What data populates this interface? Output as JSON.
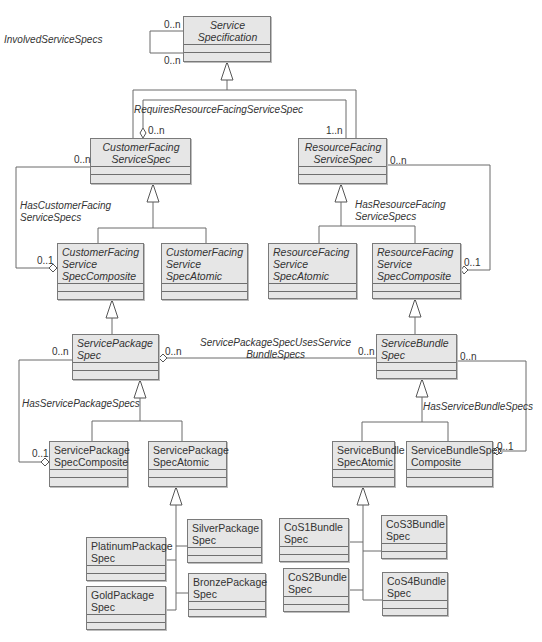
{
  "classes": [
    {
      "id": "service_specification",
      "name": "Service\nSpecification",
      "abstract": true,
      "center": true,
      "x": 183,
      "y": 16,
      "w": 88,
      "h": 46
    },
    {
      "id": "customer_facing_service_spec",
      "name": "CustomerFacing\nServiceSpec",
      "abstract": true,
      "center": true,
      "x": 90,
      "y": 138,
      "w": 101,
      "h": 46
    },
    {
      "id": "resource_facing_service_spec",
      "name": "ResourceFacing\nServiceSpec",
      "abstract": true,
      "center": true,
      "x": 298,
      "y": 138,
      "w": 89,
      "h": 46
    },
    {
      "id": "cfs_spec_composite",
      "name": "CustomerFacing\nService\nSpecComposite",
      "abstract": true,
      "center": false,
      "x": 57,
      "y": 243,
      "w": 87,
      "h": 57
    },
    {
      "id": "cfs_spec_atomic",
      "name": "CustomerFacing\nService\nSpecAtomic",
      "abstract": true,
      "center": false,
      "x": 161,
      "y": 243,
      "w": 87,
      "h": 57
    },
    {
      "id": "rfs_spec_atomic",
      "name": "ResourceFacing\nService\nSpecAtomic",
      "abstract": true,
      "center": false,
      "x": 268,
      "y": 243,
      "w": 89,
      "h": 56
    },
    {
      "id": "rfs_spec_composite",
      "name": "ResourceFacing\nService\nSpecComposite",
      "abstract": true,
      "center": false,
      "x": 372,
      "y": 243,
      "w": 89,
      "h": 56
    },
    {
      "id": "service_package_spec",
      "name": "ServicePackage\nSpec",
      "abstract": true,
      "center": false,
      "x": 72,
      "y": 334,
      "w": 87,
      "h": 46
    },
    {
      "id": "service_bundle_spec",
      "name": "ServiceBundle\nSpec",
      "abstract": true,
      "center": false,
      "x": 376,
      "y": 334,
      "w": 81,
      "h": 45
    },
    {
      "id": "service_package_spec_composite",
      "name": "ServicePackage\nSpecComposite",
      "abstract": false,
      "center": false,
      "x": 49,
      "y": 441,
      "w": 79,
      "h": 46
    },
    {
      "id": "service_package_spec_atomic",
      "name": "ServicePackage\nSpecAtomic",
      "abstract": false,
      "center": false,
      "x": 148,
      "y": 441,
      "w": 79,
      "h": 46
    },
    {
      "id": "service_bundle_spec_atomic",
      "name": "ServiceBundle\nSpecAtomic",
      "abstract": false,
      "center": false,
      "x": 332,
      "y": 441,
      "w": 63,
      "h": 46
    },
    {
      "id": "service_bundle_spec_composite",
      "name": "ServiceBundleSpec\nComposite",
      "abstract": false,
      "center": false,
      "x": 406,
      "y": 441,
      "w": 87,
      "h": 46
    },
    {
      "id": "platinum_package_spec",
      "name": "PlatinumPackage\nSpec",
      "abstract": false,
      "center": false,
      "x": 86,
      "y": 537,
      "w": 80,
      "h": 44
    },
    {
      "id": "gold_package_spec",
      "name": "GoldPackage\nSpec",
      "abstract": false,
      "center": false,
      "x": 86,
      "y": 586,
      "w": 80,
      "h": 44
    },
    {
      "id": "silver_package_spec",
      "name": "SilverPackage\nSpec",
      "abstract": false,
      "center": false,
      "x": 187,
      "y": 519,
      "w": 75,
      "h": 44
    },
    {
      "id": "bronze_package_spec",
      "name": "BronzePackage\nSpec",
      "abstract": false,
      "center": false,
      "x": 188,
      "y": 573,
      "w": 78,
      "h": 44
    },
    {
      "id": "cos1_bundle_spec",
      "name": "CoS1Bundle\nSpec",
      "abstract": false,
      "center": false,
      "x": 279,
      "y": 518,
      "w": 70,
      "h": 44
    },
    {
      "id": "cos2_bundle_spec",
      "name": "CoS2Bundle\nSpec",
      "abstract": false,
      "center": false,
      "x": 283,
      "y": 568,
      "w": 66,
      "h": 44
    },
    {
      "id": "cos3_bundle_spec",
      "name": "CoS3Bundle\nSpec",
      "abstract": false,
      "center": false,
      "x": 381,
      "y": 515,
      "w": 66,
      "h": 44
    },
    {
      "id": "cos4_bundle_spec",
      "name": "CoS4Bundle\nSpec",
      "abstract": false,
      "center": false,
      "x": 382,
      "y": 572,
      "w": 66,
      "h": 44
    }
  ],
  "associations": [
    {
      "id": "involved_service_specs",
      "name": "InvolvedServiceSpecs",
      "x": 4,
      "y": 34,
      "center": false
    },
    {
      "id": "requires_resource_facing_service_spec",
      "name": "RequiresResourceFacingServiceSpec",
      "x": 134,
      "y": 104,
      "center": false
    },
    {
      "id": "has_customer_facing_service_specs",
      "name": "HasCustomerFacing\nServiceSpecs",
      "x": 20,
      "y": 200,
      "center": false
    },
    {
      "id": "has_resource_facing_service_specs",
      "name": "HasResourceFacing\nServiceSpecs",
      "x": 355,
      "y": 199,
      "center": false
    },
    {
      "id": "service_package_spec_uses_service_bundle_specs",
      "name": "ServicePackageSpecUsesService\nBundleSpecs",
      "x": 200,
      "y": 337,
      "center": true
    },
    {
      "id": "has_service_package_specs",
      "name": "HasServicePackageSpecs",
      "x": 22,
      "y": 398,
      "center": false
    },
    {
      "id": "has_service_bundle_specs",
      "name": "HasServiceBundleSpecs",
      "x": 423,
      "y": 401,
      "center": false
    }
  ],
  "multiplicities": [
    {
      "id": "m1",
      "text": "0..n",
      "x": 164,
      "y": 19
    },
    {
      "id": "m2",
      "text": "0..n",
      "x": 164,
      "y": 55
    },
    {
      "id": "m3",
      "text": "0..n",
      "x": 148,
      "y": 125
    },
    {
      "id": "m4",
      "text": "1..n",
      "x": 326,
      "y": 125
    },
    {
      "id": "m5",
      "text": "0..n",
      "x": 74,
      "y": 154
    },
    {
      "id": "m6",
      "text": "0..n",
      "x": 390,
      "y": 155
    },
    {
      "id": "m7",
      "text": "0..1",
      "x": 37,
      "y": 255
    },
    {
      "id": "m8",
      "text": "0..1",
      "x": 464,
      "y": 257
    },
    {
      "id": "m9",
      "text": "0..n",
      "x": 52,
      "y": 346
    },
    {
      "id": "m10",
      "text": "0..n",
      "x": 165,
      "y": 346
    },
    {
      "id": "m11",
      "text": "0..n",
      "x": 358,
      "y": 346
    },
    {
      "id": "m12",
      "text": "0..n",
      "x": 460,
      "y": 351
    },
    {
      "id": "m13",
      "text": "0..1",
      "x": 32,
      "y": 448
    },
    {
      "id": "m14",
      "text": "0..1",
      "x": 497,
      "y": 441
    }
  ]
}
